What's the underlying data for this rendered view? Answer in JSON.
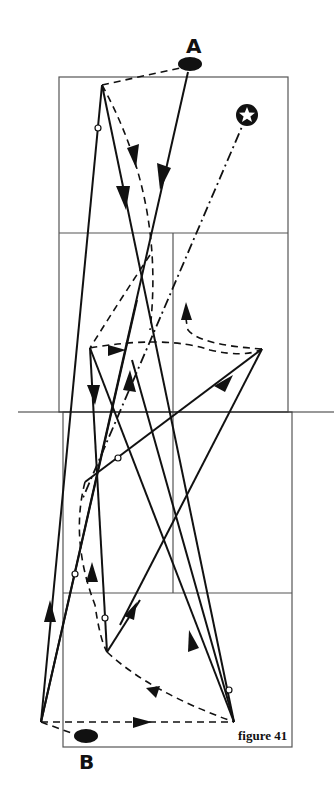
{
  "figure": {
    "caption": "figure 41",
    "player_a_label": "A",
    "player_b_label": "B",
    "colors": {
      "ink": "#111111",
      "court_line": "#555555",
      "background": "#ffffff"
    }
  },
  "court": {
    "upper": {
      "left": 59,
      "right": 288,
      "top": 77,
      "service_line": 233,
      "center_x": 173
    },
    "lower": {
      "left": 63,
      "right": 292,
      "bottom": 747,
      "service_line": 593,
      "center_x": 173
    },
    "net": {
      "y": 412,
      "x1": 18,
      "x2": 334
    }
  },
  "markers": {
    "player_a": {
      "cx": 190,
      "cy": 64,
      "rx": 12,
      "ry": 7
    },
    "player_b": {
      "cx": 86,
      "cy": 736,
      "rx": 12,
      "ry": 7
    },
    "shuttle_start_star": {
      "cx": 247,
      "cy": 115,
      "r": 11
    }
  },
  "paths": {
    "shots": [
      {
        "from": [
          102,
          85
        ],
        "to": [
          41,
          722
        ],
        "arrow_at": null,
        "contact_dot": [
          98,
          128
        ]
      },
      {
        "from": [
          102,
          85
        ],
        "to": [
          234,
          722
        ],
        "arrow_at": [
          125,
          200
        ]
      },
      {
        "from": [
          188,
          72
        ],
        "to": [
          41,
          722
        ],
        "arrow_at": [
          162,
          190
        ]
      },
      {
        "from": [
          90,
          348
        ],
        "to": [
          107,
          652
        ],
        "arrow_at": [
          96,
          395
        ]
      },
      {
        "from": [
          90,
          348
        ],
        "to": [
          234,
          722
        ],
        "arrow_at": null
      },
      {
        "from": [
          262,
          349
        ],
        "to": [
          85,
          482
        ],
        "arrow_at": [
          235,
          375
        ]
      },
      {
        "from": [
          262,
          349
        ],
        "to": [
          120,
          625
        ],
        "arrow_at": null
      },
      {
        "from": [
          85,
          482
        ],
        "to": [
          262,
          349
        ],
        "contact_dot": [
          118,
          458
        ]
      },
      {
        "from": [
          107,
          652
        ],
        "to": [
          140,
          600
        ],
        "arrow_at": [
          130,
          612
        ]
      },
      {
        "from": [
          234,
          722
        ],
        "to": [
          130,
          360
        ],
        "arrow_at": [
          210,
          640
        ],
        "contact_dot": [
          229,
          690
        ]
      },
      {
        "from": [
          41,
          722
        ],
        "to": [
          88,
          180
        ],
        "arrow_at": [
          48,
          655
        ]
      },
      {
        "from": [
          41,
          722
        ],
        "to": [
          140,
          280
        ],
        "contact_dot": [
          75,
          574
        ]
      },
      {
        "from": [
          107,
          652
        ],
        "to": [
          103,
          335
        ],
        "contact_dot": [
          104,
          590
        ]
      }
    ],
    "movements_dashed": [
      {
        "d": "M102 85 Q 165 200 150 330 Q 140 380 135 420"
      },
      {
        "d": "M102 85 L 180 70"
      },
      {
        "d": "M90 348 Q 160 330 200 345 Q 240 360 262 349"
      },
      {
        "d": "M262 349 Q 200 345 188 330 Q 185 318 186 302"
      },
      {
        "d": "M85 482 Q 70 540 95 600 Q 100 640 107 652"
      },
      {
        "d": "M107 652 Q 150 690 234 722"
      },
      {
        "d": "M41 722 L 234 722"
      },
      {
        "d": "M41 722 L 75 734"
      }
    ],
    "dash_dot_shuttle": {
      "from": [
        247,
        115
      ],
      "to": [
        82,
        500
      ]
    }
  }
}
